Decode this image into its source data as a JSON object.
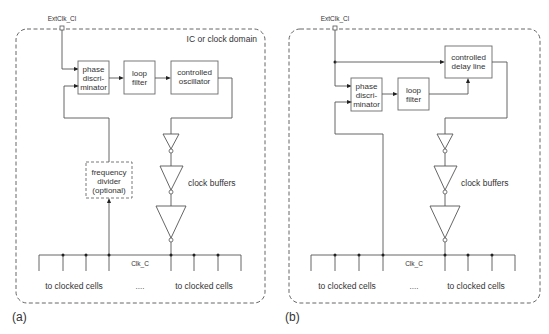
{
  "panels": {
    "a": {
      "caption": "(a)",
      "domain_label": "IC or clock domain",
      "input_pin": "ExtClk_Cl",
      "blocks": {
        "phase_disc": [
          "phase",
          "discri-",
          "minator"
        ],
        "loop_filter": [
          "loop",
          "filter"
        ],
        "controlled": [
          "controlled",
          "oscillator"
        ],
        "divider": [
          "frequency",
          "divider",
          "(optional)"
        ]
      },
      "buffers_label": "clock buffers",
      "bus_label": "Clk_C",
      "cells_left": "to clocked cells",
      "ellipsis": "....",
      "cells_right": "to clocked cells"
    },
    "b": {
      "caption": "(b)",
      "input_pin": "ExtClk_Cl",
      "blocks": {
        "phase_disc": [
          "phase",
          "discri-",
          "minator"
        ],
        "loop_filter": [
          "loop",
          "filter"
        ],
        "controlled": [
          "controlled",
          "delay line"
        ]
      },
      "buffers_label": "clock buffers",
      "bus_label": "Clk_C",
      "cells_left": "to clocked cells",
      "ellipsis": "....",
      "cells_right": "to clocked cells"
    }
  }
}
